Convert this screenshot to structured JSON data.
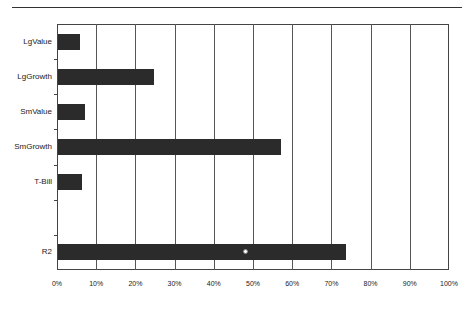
{
  "chart_data": {
    "type": "bar",
    "orientation": "horizontal",
    "title": "",
    "xlabel": "",
    "ylabel": "",
    "categories": [
      "LgValue",
      "LgGrowth",
      "SmValue",
      "SmGrowth",
      "T-Bill",
      "",
      "R2"
    ],
    "values": [
      5.5,
      24.5,
      7,
      57,
      6,
      null,
      73.5
    ],
    "units": "%",
    "xlim": [
      0,
      100
    ],
    "x_ticks": [
      "0%",
      "10%",
      "20%",
      "30%",
      "40%",
      "50%",
      "60%",
      "70%",
      "80%",
      "90%",
      "100%"
    ],
    "grid": true,
    "legend": null,
    "bar_color": "#2b2b2b",
    "annotations": [
      "small white circular marker on R2 bar near 48%"
    ]
  }
}
